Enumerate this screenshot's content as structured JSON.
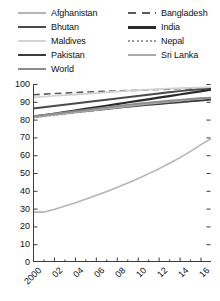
{
  "legend": {
    "columns": [
      {
        "items": [
          {
            "label": "Afghanistan",
            "color": "#b4b4b4",
            "style": "solid",
            "width": 2
          },
          {
            "label": "Bhutan",
            "color": "#4a4a4a",
            "style": "solid",
            "width": 2.4
          },
          {
            "label": "Maldives",
            "color": "#d2d2d2",
            "style": "solid",
            "width": 2
          },
          {
            "label": "Pakistan",
            "color": "#3c3c3c",
            "style": "solid",
            "width": 2.4
          },
          {
            "label": "World",
            "color": "#8c8c8c",
            "style": "solid",
            "width": 2.2
          }
        ]
      },
      {
        "items": [
          {
            "label": "Bangladesh",
            "color": "#5a5a5a",
            "style": "dashed",
            "width": 2
          },
          {
            "label": "India",
            "color": "#2b2b2b",
            "style": "solid",
            "width": 2.6
          },
          {
            "label": "Nepal",
            "color": "#9a9a9a",
            "style": "dotted",
            "width": 2
          },
          {
            "label": "Sri Lanka",
            "color": "#a8a8a8",
            "style": "solid",
            "width": 2
          }
        ]
      }
    ]
  },
  "axes": {
    "y_ticks": [
      "0",
      "10",
      "20",
      "30",
      "40",
      "50",
      "60",
      "70",
      "80",
      "90",
      "100"
    ],
    "x_ticks": [
      "2000",
      "02",
      "04",
      "06",
      "08",
      "10",
      "12",
      "14",
      "16"
    ]
  },
  "chart_data": {
    "type": "line",
    "title": "",
    "subtitle": "",
    "xlabel": "",
    "ylabel": "",
    "xlim": [
      2000,
      2017
    ],
    "ylim": [
      0,
      100
    ],
    "grid": false,
    "legend_position": "top",
    "x": [
      2000,
      2001,
      2002,
      2003,
      2004,
      2005,
      2006,
      2007,
      2008,
      2009,
      2010,
      2011,
      2012,
      2013,
      2014,
      2015,
      2016,
      2017
    ],
    "x_tick_values": [
      2000,
      2002,
      2004,
      2006,
      2008,
      2010,
      2012,
      2014,
      2016
    ],
    "x_tick_labels": [
      "2000",
      "02",
      "04",
      "06",
      "08",
      "10",
      "12",
      "14",
      "16"
    ],
    "y_tick_values": [
      0,
      10,
      20,
      30,
      40,
      50,
      60,
      70,
      80,
      90,
      100
    ],
    "series": [
      {
        "name": "Afghanistan",
        "color": "#b4b4b4",
        "style": "solid",
        "width": 1.6,
        "values": [
          28.0,
          28.0,
          29.5,
          31.3,
          33.2,
          35.2,
          37.3,
          39.5,
          41.8,
          44.2,
          46.8,
          49.5,
          52.3,
          55.3,
          58.5,
          62.0,
          65.8,
          69.3
        ]
      },
      {
        "name": "Bangladesh",
        "color": "#5a5a5a",
        "style": "dashed",
        "width": 1.6,
        "values": [
          94.0,
          94.3,
          94.6,
          94.9,
          95.2,
          95.5,
          95.7,
          95.9,
          96.1,
          96.3,
          96.5,
          96.7,
          96.9,
          97.1,
          97.3,
          97.5,
          97.7,
          97.9
        ]
      },
      {
        "name": "Bhutan",
        "color": "#4a4a4a",
        "style": "solid",
        "width": 2.0,
        "values": [
          86.3,
          87.0,
          87.7,
          88.4,
          89.1,
          89.8,
          90.5,
          91.2,
          91.9,
          92.6,
          93.3,
          94.0,
          94.7,
          95.4,
          96.0,
          96.6,
          97.1,
          97.6
        ]
      },
      {
        "name": "India",
        "color": "#2b2b2b",
        "style": "solid",
        "width": 2.2,
        "values": [
          81.5,
          82.4,
          83.3,
          84.2,
          85.1,
          86.0,
          86.9,
          87.8,
          88.7,
          89.6,
          90.5,
          91.4,
          92.3,
          93.2,
          94.1,
          95.0,
          95.9,
          96.8
        ]
      },
      {
        "name": "Maldives",
        "color": "#d2d2d2",
        "style": "solid",
        "width": 1.8,
        "values": [
          92.5,
          92.9,
          93.3,
          93.7,
          94.1,
          94.5,
          94.9,
          95.3,
          95.7,
          96.1,
          96.5,
          96.8,
          97.1,
          97.4,
          97.6,
          97.8,
          98.0,
          98.2
        ]
      },
      {
        "name": "Nepal",
        "color": "#9a9a9a",
        "style": "dotted",
        "width": 1.8,
        "values": [
          81.0,
          81.7,
          82.4,
          83.1,
          83.8,
          84.5,
          85.2,
          85.9,
          86.6,
          87.2,
          87.8,
          88.4,
          88.9,
          89.4,
          89.9,
          90.4,
          90.8,
          91.2
        ]
      },
      {
        "name": "Pakistan",
        "color": "#3c3c3c",
        "style": "solid",
        "width": 2.0,
        "values": [
          81.8,
          82.4,
          83.0,
          83.6,
          84.2,
          84.8,
          85.4,
          86.0,
          86.6,
          87.2,
          87.8,
          88.3,
          88.8,
          89.3,
          89.8,
          90.3,
          90.8,
          91.3
        ]
      },
      {
        "name": "Sri Lanka",
        "color": "#a8a8a8",
        "style": "solid",
        "width": 1.8,
        "values": [
          81.2,
          81.9,
          82.6,
          83.3,
          84.0,
          84.7,
          85.4,
          86.1,
          86.8,
          87.5,
          88.2,
          88.8,
          89.4,
          90.0,
          90.6,
          91.2,
          91.7,
          92.2
        ]
      },
      {
        "name": "World",
        "color": "#8c8c8c",
        "style": "solid",
        "width": 1.8,
        "values": [
          82.0,
          82.7,
          83.4,
          84.1,
          84.8,
          85.5,
          86.2,
          86.9,
          87.6,
          88.3,
          88.9,
          89.5,
          90.1,
          90.6,
          91.1,
          91.6,
          92.0,
          92.4
        ]
      }
    ]
  }
}
